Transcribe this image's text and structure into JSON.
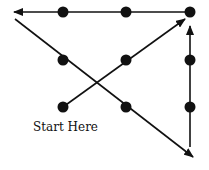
{
  "label": "Start Here",
  "colors": {
    "ink": "#111111",
    "background": "#ffffff"
  },
  "dots": [
    {
      "row": 1,
      "col": 1
    },
    {
      "row": 1,
      "col": 2
    },
    {
      "row": 1,
      "col": 3
    },
    {
      "row": 2,
      "col": 1
    },
    {
      "row": 2,
      "col": 2
    },
    {
      "row": 2,
      "col": 3
    },
    {
      "row": 3,
      "col": 1
    },
    {
      "row": 3,
      "col": 2
    },
    {
      "row": 3,
      "col": 3
    }
  ],
  "path": [
    {
      "step": 1,
      "from": "bottom-left dot",
      "to": "beyond top-right dot",
      "direction": "up-right"
    },
    {
      "step": 2,
      "from": "top-right dot",
      "to": "beyond top-left dot",
      "direction": "left"
    },
    {
      "step": 3,
      "from": "left of top-left",
      "to": "beyond bottom-right",
      "direction": "down-right"
    },
    {
      "step": 4,
      "from": "below bottom-right",
      "to": "top-right dot",
      "direction": "up"
    }
  ]
}
